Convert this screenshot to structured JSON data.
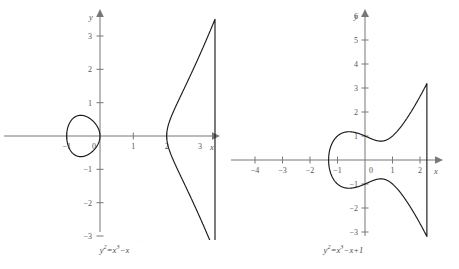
{
  "figure": {
    "type": "math-figure",
    "background_color": "#ffffff",
    "curve_color": "#1a1a1a",
    "axis_color": "#777777"
  },
  "chart_data": [
    {
      "type": "line",
      "title": "y²=x³−x",
      "equation": "y^2 = x^3 - x",
      "caption_main": "y",
      "caption_sup1": "2",
      "caption_mid": "=x",
      "caption_sup2": "3",
      "caption_end": "−x",
      "xlabel": "x",
      "ylabel": "y",
      "xlim": [
        -1.85,
        3.7
      ],
      "ylim": [
        -3.45,
        3.6
      ],
      "xticks": [
        -1,
        0,
        1,
        2,
        3
      ],
      "xtick_labels": [
        "−1",
        "0",
        "1",
        "2",
        "3"
      ],
      "yticks": [
        -3,
        -2,
        -1,
        1,
        2,
        3
      ],
      "ytick_labels": [
        "−3",
        "−2",
        "−1",
        "1",
        "2",
        "3"
      ],
      "grid": false,
      "legend": false,
      "x_roots": [
        -1,
        0,
        1
      ],
      "components": [
        {
          "name": "oval",
          "x_range": [
            -1,
            0
          ],
          "closed": true
        },
        {
          "name": "unbounded-branch",
          "x_range": [
            1,
            3.45
          ],
          "closed": false
        }
      ],
      "branch_x_start_drawn": 2.0,
      "branch_x_end_drawn": 3.45,
      "notes": "Oval passes through x=-1 and x=0; visible right branch meets axis near x=2"
    },
    {
      "type": "line",
      "title": "y²=x³−x+1",
      "equation": "y^2 = x^3 - x + 1",
      "caption_main": "y",
      "caption_sup1": "2",
      "caption_mid": "=x",
      "caption_sup2": "3",
      "caption_end": "−x+1",
      "xlabel": "x",
      "ylabel": "y",
      "xlim": [
        -4.6,
        2.6
      ],
      "ylim": [
        -3.6,
        6.2
      ],
      "xticks": [
        -4,
        -3,
        -2,
        -1,
        0,
        1,
        2
      ],
      "xtick_labels": [
        "−4",
        "−3",
        "−2",
        "−1",
        "0",
        "1",
        "2"
      ],
      "yticks": [
        -3,
        -2,
        -1,
        1,
        2,
        3,
        4,
        5,
        6
      ],
      "ytick_labels": [
        "−3",
        "−2",
        "−1",
        "1",
        "2",
        "3",
        "4",
        "5",
        "6"
      ],
      "grid": false,
      "legend": false,
      "x_roots": [
        -1.3247
      ],
      "y_intercepts": [
        1,
        -1
      ],
      "components": [
        {
          "name": "single-connected-branch",
          "x_range": [
            -1.3247,
            2.25
          ],
          "closed": false
        }
      ],
      "notes": "Single connected component; leftmost root at x ≈ -1.325; y-intercepts at ±1"
    }
  ]
}
